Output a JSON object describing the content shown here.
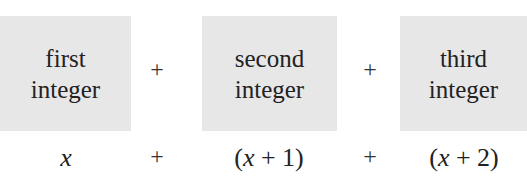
{
  "boxes": [
    {
      "line1": "first",
      "line2": "integer"
    },
    {
      "line1": "second",
      "line2": "integer"
    },
    {
      "line1": "third",
      "line2": "integer"
    }
  ],
  "operators": {
    "top": [
      "+",
      "+"
    ],
    "bottom": [
      "+",
      "+"
    ]
  },
  "expressions": [
    {
      "open": "",
      "var": "x",
      "rest": ""
    },
    {
      "open": "(",
      "var": "x",
      "rest": " + 1)"
    },
    {
      "open": "(",
      "var": "x",
      "rest": " + 2)"
    }
  ],
  "colors": {
    "box_fill": "#e7e7e7",
    "text": "#222222"
  }
}
